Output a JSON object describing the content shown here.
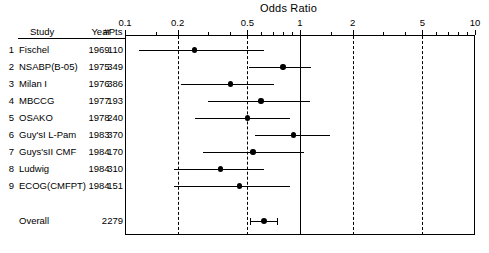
{
  "chart_data": {
    "type": "forest",
    "title": "Odds Ratio",
    "xlabel": "Odds Ratio",
    "ylabel": "",
    "xscale": "log",
    "xlim": [
      0.1,
      10
    ],
    "grid": true,
    "gridlines_dashed": [
      0.2,
      0.5,
      2,
      5
    ],
    "gridline_solid": [
      1
    ],
    "tick_labels": [
      "0.1",
      "0.2",
      "0.5",
      "1",
      "2",
      "5",
      "10"
    ],
    "tick_values": [
      0.1,
      0.2,
      0.5,
      1,
      2,
      5,
      10
    ],
    "minor_ticks": [
      0.15,
      0.3,
      0.4,
      0.6,
      0.7,
      0.8,
      0.9,
      1.5,
      3,
      4,
      6,
      7,
      8,
      9
    ],
    "columns": [
      "Study",
      "Year",
      "#Pts"
    ],
    "rows": [
      {
        "index": "1",
        "study": "Fischel",
        "year": "1969",
        "pts": "110",
        "or": 0.25,
        "lo": 0.12,
        "hi": 0.62
      },
      {
        "index": "2",
        "study": "NSABP(B-05)",
        "year": "1975",
        "pts": "349",
        "or": 0.8,
        "lo": 0.51,
        "hi": 1.15
      },
      {
        "index": "3",
        "study": "Milan I",
        "year": "1976",
        "pts": "386",
        "or": 0.4,
        "lo": 0.21,
        "hi": 0.71
      },
      {
        "index": "4",
        "study": "MBCCG",
        "year": "1977",
        "pts": "193",
        "or": 0.6,
        "lo": 0.3,
        "hi": 1.14
      },
      {
        "index": "5",
        "study": "OSAKO",
        "year": "1978",
        "pts": "240",
        "or": 0.5,
        "lo": 0.25,
        "hi": 0.88
      },
      {
        "index": "6",
        "study": "Guy'sI L-Pam",
        "year": "1983",
        "pts": "370",
        "or": 0.92,
        "lo": 0.55,
        "hi": 1.48
      },
      {
        "index": "7",
        "study": "Guys'sII CMF",
        "year": "1984",
        "pts": "170",
        "or": 0.54,
        "lo": 0.28,
        "hi": 1.05
      },
      {
        "index": "8",
        "study": "Ludwig",
        "year": "1984",
        "pts": "310",
        "or": 0.35,
        "lo": 0.19,
        "hi": 0.62
      },
      {
        "index": "9",
        "study": "ECOG(CMFPT)",
        "year": "1984",
        "pts": "151",
        "or": 0.45,
        "lo": 0.19,
        "hi": 0.88
      }
    ],
    "overall": {
      "index": "",
      "study": "Overall",
      "year": "",
      "pts": "2279",
      "or": 0.62,
      "lo": 0.52,
      "hi": 0.74
    }
  }
}
